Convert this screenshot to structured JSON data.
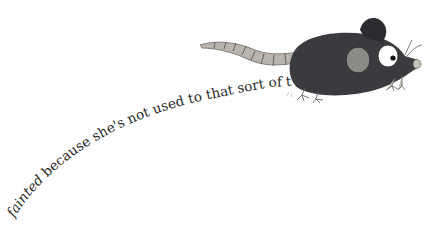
{
  "caption": {
    "emphasis": "fainted",
    "rest": " because she's not used to that sort of thing."
  },
  "illustration": {
    "subject": "mouse-illustration",
    "colors": {
      "body": "#3b3a3e",
      "body_shade": "#2c2b2f",
      "cheek": "#8a8a86",
      "tail": "#b9b4ae",
      "tail_line": "#5a5550",
      "eye_white": "#ffffff",
      "pupil": "#111111",
      "nose": "#c9c3bb",
      "feet": "#bfbab3"
    }
  }
}
